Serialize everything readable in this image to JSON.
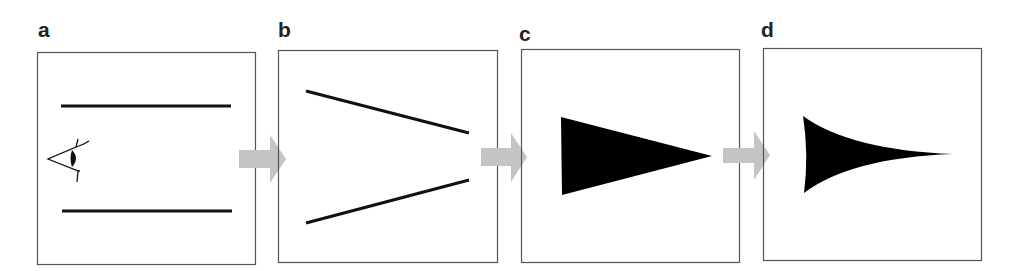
{
  "figure": {
    "panels": [
      {
        "id": "a",
        "label": "a",
        "content": "two parallel horizontal lines with an eye viewing from the left"
      },
      {
        "id": "b",
        "label": "b",
        "content": "two lines converging toward the right"
      },
      {
        "id": "c",
        "label": "c",
        "content": "filled black triangle pointing right"
      },
      {
        "id": "d",
        "label": "d",
        "content": "filled black shape with concave curved sides tapering to a point on the right"
      }
    ],
    "arrows": [
      "a-to-b",
      "b-to-c",
      "c-to-d"
    ],
    "colors": {
      "stroke": "#111111",
      "box": "#555555",
      "arrow": "#c4c4c4",
      "fill": "#000000"
    }
  }
}
